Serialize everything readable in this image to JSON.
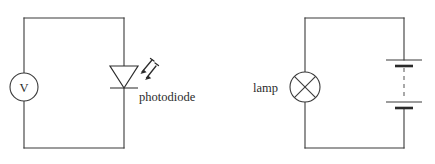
{
  "figure": {
    "background_color": "#ffffff",
    "line_color": "#3a3a3a",
    "dashed_color": "#8d8d8d"
  },
  "circuits": [
    {
      "id": "photodiode-circuit",
      "name": "photodiode-voltmeter-circuit",
      "loop": {
        "left": 24,
        "top": 18,
        "right": 124,
        "bottom": 148
      },
      "components": [
        {
          "id": "voltmeter",
          "name": "voltmeter",
          "type": "meter",
          "symbol_glyph": "V",
          "label": "",
          "position": {
            "cx": 24,
            "cy": 87,
            "r": 14
          }
        },
        {
          "id": "photodiode",
          "name": "photodiode",
          "type": "photodiode",
          "symbol_glyph": "",
          "label": "photodiode",
          "position": {
            "cx": 124,
            "cy": 77,
            "width": 28,
            "height": 22
          },
          "light_rays": 2,
          "ray_direction": "incoming-down-left"
        }
      ]
    },
    {
      "id": "lamp-circuit",
      "name": "lamp-battery-circuit",
      "loop": {
        "left": 305,
        "top": 18,
        "right": 404,
        "bottom": 148
      },
      "components": [
        {
          "id": "lamp",
          "name": "lamp",
          "type": "lamp",
          "symbol_glyph": "X",
          "label": "lamp",
          "position": {
            "cx": 305,
            "cy": 87,
            "r": 15
          }
        },
        {
          "id": "battery",
          "name": "battery",
          "type": "battery",
          "symbol_glyph": "",
          "label": "",
          "cells": 2,
          "position": {
            "cx": 404,
            "top_plate_y": 60,
            "bottom_plate_y": 108,
            "long_plate_half": 18,
            "short_plate_half": 9
          }
        }
      ]
    }
  ],
  "labels": {
    "photodiode": "photodiode",
    "lamp": "lamp",
    "voltmeter_symbol": "V"
  }
}
